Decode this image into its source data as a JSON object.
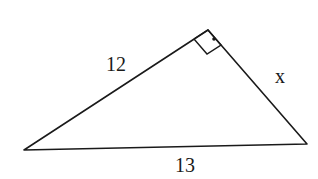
{
  "diagram": {
    "type": "right-triangle",
    "labels": {
      "hyp_side": "12",
      "right_side": "x",
      "base": "13"
    },
    "vertices": {
      "left": [
        24,
        150
      ],
      "apex": [
        218,
        18
      ],
      "right": [
        307,
        144
      ]
    },
    "right_angle_marker": "square with dot",
    "stroke_color": "#1a1a1a"
  }
}
